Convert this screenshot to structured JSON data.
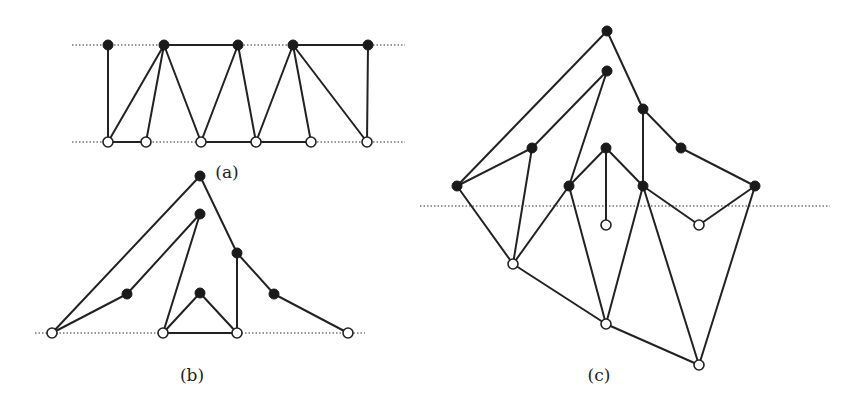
{
  "figure": {
    "panels": [
      {
        "id": "a",
        "label": "(a)",
        "label_pos": [
          227,
          178
        ],
        "guides": [
          {
            "x1": 72,
            "y1": 45,
            "x2": 405,
            "y2": 45
          },
          {
            "x1": 72,
            "y1": 142,
            "x2": 405,
            "y2": 142
          }
        ],
        "nodes": [
          {
            "id": "t1",
            "x": 108,
            "y": 45,
            "type": "filled"
          },
          {
            "id": "t2",
            "x": 164,
            "y": 45,
            "type": "filled"
          },
          {
            "id": "t3",
            "x": 238,
            "y": 45,
            "type": "filled"
          },
          {
            "id": "t4",
            "x": 293,
            "y": 45,
            "type": "filled"
          },
          {
            "id": "t5",
            "x": 368,
            "y": 45,
            "type": "filled"
          },
          {
            "id": "b1",
            "x": 108,
            "y": 142,
            "type": "open"
          },
          {
            "id": "b2",
            "x": 146,
            "y": 142,
            "type": "open"
          },
          {
            "id": "b3",
            "x": 201,
            "y": 142,
            "type": "open"
          },
          {
            "id": "b4",
            "x": 256,
            "y": 142,
            "type": "open"
          },
          {
            "id": "b5",
            "x": 311,
            "y": 142,
            "type": "open"
          },
          {
            "id": "b6",
            "x": 367,
            "y": 142,
            "type": "open"
          }
        ],
        "edges": [
          [
            "t2",
            "t3"
          ],
          [
            "t4",
            "t5"
          ],
          [
            "t1",
            "b1"
          ],
          [
            "t2",
            "b1"
          ],
          [
            "t2",
            "b2"
          ],
          [
            "t2",
            "b3"
          ],
          [
            "t3",
            "b3"
          ],
          [
            "t3",
            "b4"
          ],
          [
            "t4",
            "b4"
          ],
          [
            "t4",
            "b5"
          ],
          [
            "t4",
            "b6"
          ],
          [
            "t5",
            "b6"
          ],
          [
            "b1",
            "b2"
          ],
          [
            "b3",
            "b4"
          ],
          [
            "b4",
            "b5"
          ]
        ]
      },
      {
        "id": "b",
        "label": "(b)",
        "label_pos": [
          192,
          381
        ],
        "guides": [
          {
            "x1": 35,
            "y1": 333,
            "x2": 365,
            "y2": 333
          }
        ],
        "nodes": [
          {
            "id": "p",
            "x": 200,
            "y": 176,
            "type": "filled"
          },
          {
            "id": "q",
            "x": 200,
            "y": 214,
            "type": "filled"
          },
          {
            "id": "r",
            "x": 237,
            "y": 253,
            "type": "filled"
          },
          {
            "id": "s",
            "x": 127,
            "y": 294,
            "type": "filled"
          },
          {
            "id": "u",
            "x": 200,
            "y": 293,
            "type": "filled"
          },
          {
            "id": "v",
            "x": 274,
            "y": 294,
            "type": "filled"
          },
          {
            "id": "w1",
            "x": 52,
            "y": 333,
            "type": "open"
          },
          {
            "id": "w2",
            "x": 163,
            "y": 333,
            "type": "open"
          },
          {
            "id": "w3",
            "x": 237,
            "y": 333,
            "type": "open"
          },
          {
            "id": "w4",
            "x": 348,
            "y": 333,
            "type": "open"
          }
        ],
        "edges": [
          [
            "w1",
            "p"
          ],
          [
            "p",
            "r"
          ],
          [
            "r",
            "v"
          ],
          [
            "v",
            "w4"
          ],
          [
            "w1",
            "s"
          ],
          [
            "s",
            "q"
          ],
          [
            "q",
            "w2"
          ],
          [
            "w2",
            "u"
          ],
          [
            "u",
            "w3"
          ],
          [
            "r",
            "w3"
          ],
          [
            "w2",
            "w3"
          ]
        ]
      },
      {
        "id": "c",
        "label": "(c)",
        "label_pos": [
          599,
          381
        ],
        "guides": [
          {
            "x1": 420,
            "y1": 206,
            "x2": 830,
            "y2": 206
          }
        ],
        "nodes": [
          {
            "id": "A",
            "x": 607,
            "y": 31,
            "type": "filled"
          },
          {
            "id": "B",
            "x": 607,
            "y": 71,
            "type": "filled"
          },
          {
            "id": "C",
            "x": 643,
            "y": 109,
            "type": "filled"
          },
          {
            "id": "D",
            "x": 532,
            "y": 148,
            "type": "filled"
          },
          {
            "id": "E",
            "x": 606,
            "y": 148,
            "type": "filled"
          },
          {
            "id": "F",
            "x": 681,
            "y": 148,
            "type": "filled"
          },
          {
            "id": "G",
            "x": 457,
            "y": 186,
            "type": "filled"
          },
          {
            "id": "H",
            "x": 569,
            "y": 186,
            "type": "filled"
          },
          {
            "id": "I",
            "x": 643,
            "y": 186,
            "type": "filled"
          },
          {
            "id": "J",
            "x": 755,
            "y": 186,
            "type": "filled"
          },
          {
            "id": "K",
            "x": 606,
            "y": 225,
            "type": "open"
          },
          {
            "id": "L",
            "x": 699,
            "y": 225,
            "type": "open"
          },
          {
            "id": "M",
            "x": 513,
            "y": 264,
            "type": "open"
          },
          {
            "id": "N",
            "x": 606,
            "y": 324,
            "type": "open"
          },
          {
            "id": "O",
            "x": 699,
            "y": 365,
            "type": "open"
          }
        ],
        "edges": [
          [
            "A",
            "G"
          ],
          [
            "A",
            "C"
          ],
          [
            "B",
            "D"
          ],
          [
            "B",
            "H"
          ],
          [
            "C",
            "I"
          ],
          [
            "C",
            "F"
          ],
          [
            "D",
            "G"
          ],
          [
            "D",
            "M"
          ],
          [
            "E",
            "H"
          ],
          [
            "E",
            "K"
          ],
          [
            "E",
            "I"
          ],
          [
            "F",
            "J"
          ],
          [
            "G",
            "M"
          ],
          [
            "H",
            "M"
          ],
          [
            "H",
            "N"
          ],
          [
            "I",
            "N"
          ],
          [
            "I",
            "O"
          ],
          [
            "I",
            "L"
          ],
          [
            "J",
            "L"
          ],
          [
            "J",
            "O"
          ],
          [
            "M",
            "N"
          ],
          [
            "N",
            "O"
          ]
        ]
      }
    ],
    "style": {
      "node_radius": 5,
      "edge_color": "#222222",
      "filled_node_color": "#1a1a1a",
      "open_node_fill": "#ffffff"
    }
  }
}
